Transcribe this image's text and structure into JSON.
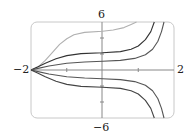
{
  "chart_data": {
    "type": "line",
    "title": "",
    "xlabel": "",
    "ylabel": "",
    "xlim": [
      -2,
      2
    ],
    "ylim": [
      -6,
      6
    ],
    "grid": false,
    "legend": null,
    "tick_labels": {
      "x_min": "−2",
      "x_max": "2",
      "y_max": "6",
      "y_min": "−6"
    },
    "annotations": [],
    "series": [
      {
        "name": "curve-1",
        "color": "#b0b0b0",
        "points": [
          [
            -2,
            0
          ],
          [
            -1.8,
            0.4
          ],
          [
            -1.6,
            1.2
          ],
          [
            -1.4,
            2.2
          ],
          [
            -1.2,
            3.2
          ],
          [
            -1.0,
            3.9
          ],
          [
            -0.8,
            4.4
          ],
          [
            -0.5,
            4.7
          ],
          [
            0,
            4.85
          ],
          [
            0.3,
            5.0
          ],
          [
            0.6,
            5.3
          ],
          [
            0.8,
            5.7
          ],
          [
            0.95,
            6
          ]
        ]
      },
      {
        "name": "curve-2",
        "color": "#333333",
        "points": [
          [
            -2,
            0
          ],
          [
            -1.8,
            0.4
          ],
          [
            -1.6,
            0.85
          ],
          [
            -1.3,
            1.4
          ],
          [
            -1.0,
            1.8
          ],
          [
            -0.6,
            2.05
          ],
          [
            0,
            2.15
          ],
          [
            0.5,
            2.3
          ],
          [
            0.8,
            2.6
          ],
          [
            1.0,
            3.0
          ],
          [
            1.2,
            3.8
          ],
          [
            1.35,
            4.8
          ],
          [
            1.45,
            6
          ]
        ]
      },
      {
        "name": "curve-3",
        "color": "#555555",
        "points": [
          [
            -2,
            0
          ],
          [
            -1.8,
            0.2
          ],
          [
            -1.5,
            0.5
          ],
          [
            -1.0,
            0.85
          ],
          [
            -0.5,
            1.0
          ],
          [
            0,
            1.1
          ],
          [
            0.5,
            1.2
          ],
          [
            0.9,
            1.45
          ],
          [
            1.2,
            1.9
          ],
          [
            1.4,
            2.6
          ],
          [
            1.55,
            3.6
          ],
          [
            1.65,
            4.8
          ],
          [
            1.72,
            6
          ]
        ]
      },
      {
        "name": "curve-4",
        "color": "#555555",
        "points": [
          [
            -2,
            0
          ],
          [
            -1.8,
            -0.2
          ],
          [
            -1.5,
            -0.5
          ],
          [
            -1.0,
            -0.85
          ],
          [
            -0.5,
            -1.0
          ],
          [
            0,
            -1.1
          ],
          [
            0.5,
            -1.2
          ],
          [
            0.9,
            -1.45
          ],
          [
            1.2,
            -1.9
          ],
          [
            1.4,
            -2.6
          ],
          [
            1.55,
            -3.6
          ],
          [
            1.65,
            -4.8
          ],
          [
            1.72,
            -6
          ]
        ]
      },
      {
        "name": "curve-5",
        "color": "#444444",
        "points": [
          [
            -2,
            0
          ],
          [
            -1.8,
            -0.4
          ],
          [
            -1.6,
            -0.85
          ],
          [
            -1.3,
            -1.4
          ],
          [
            -1.0,
            -1.8
          ],
          [
            -0.6,
            -2.05
          ],
          [
            0,
            -2.15
          ],
          [
            0.5,
            -2.3
          ],
          [
            0.8,
            -2.6
          ],
          [
            1.0,
            -3.0
          ],
          [
            1.2,
            -3.8
          ],
          [
            1.35,
            -4.8
          ],
          [
            1.45,
            -6
          ]
        ]
      },
      {
        "name": "x-axis-line",
        "color": "#666666",
        "points": [
          [
            -2,
            0
          ],
          [
            2,
            0
          ]
        ]
      }
    ]
  }
}
